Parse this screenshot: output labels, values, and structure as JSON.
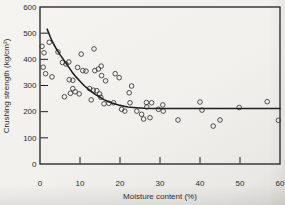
{
  "colors": {
    "paper": "#f2f1ee",
    "ink": "#1f1f1f",
    "marker_stroke": "#3d3d3d"
  },
  "chart_data": {
    "type": "scatter",
    "title": "",
    "xlabel": "Moisture content (%)",
    "ylabel": "Crushing strength (kg/cm²)",
    "xlim": [
      0,
      60
    ],
    "ylim": [
      0,
      600
    ],
    "x_ticks": [
      0,
      10,
      20,
      30,
      40,
      50,
      60
    ],
    "y_ticks": [
      0,
      100,
      200,
      300,
      400,
      500,
      600
    ],
    "grid": false,
    "legend": "none",
    "marker": "open-circle",
    "series": [
      {
        "name": "observed-crushing-strength",
        "type": "scatter",
        "points": [
          [
            0.5,
            450
          ],
          [
            1.0,
            425
          ],
          [
            2.3,
            465
          ],
          [
            4.5,
            428
          ],
          [
            0.8,
            370
          ],
          [
            1.4,
            345
          ],
          [
            3.0,
            333
          ],
          [
            5.6,
            388
          ],
          [
            6.5,
            382
          ],
          [
            7.2,
            390
          ],
          [
            9.4,
            369
          ],
          [
            10.7,
            357
          ],
          [
            11.5,
            355
          ],
          [
            10.3,
            420
          ],
          [
            13.5,
            440
          ],
          [
            13.7,
            357
          ],
          [
            14.6,
            363
          ],
          [
            15.3,
            374
          ],
          [
            7.3,
            322
          ],
          [
            8.2,
            320
          ],
          [
            6.1,
            257
          ],
          [
            7.6,
            270
          ],
          [
            8.2,
            288
          ],
          [
            8.8,
            276
          ],
          [
            9.8,
            268
          ],
          [
            12.4,
            288
          ],
          [
            13.3,
            282
          ],
          [
            14.2,
            280
          ],
          [
            14.9,
            268
          ],
          [
            12.8,
            245
          ],
          [
            15.4,
            338
          ],
          [
            16.4,
            318
          ],
          [
            15.2,
            255
          ],
          [
            16.0,
            230
          ],
          [
            17.2,
            232
          ],
          [
            18.4,
            234
          ],
          [
            18.8,
            345
          ],
          [
            19.8,
            330
          ],
          [
            20.4,
            209
          ],
          [
            21.2,
            202
          ],
          [
            22.3,
            272
          ],
          [
            22.9,
            298
          ],
          [
            22.5,
            234
          ],
          [
            24.2,
            202
          ],
          [
            25.4,
            190
          ],
          [
            25.9,
            172
          ],
          [
            26.6,
            235
          ],
          [
            26.7,
            218
          ],
          [
            27.5,
            177
          ],
          [
            27.9,
            234
          ],
          [
            29.6,
            209
          ],
          [
            30.8,
            202
          ],
          [
            30.7,
            226
          ],
          [
            34.5,
            168
          ],
          [
            40.0,
            237
          ],
          [
            40.5,
            206
          ],
          [
            43.3,
            145
          ],
          [
            45.0,
            168
          ],
          [
            49.8,
            216
          ],
          [
            56.8,
            238
          ],
          [
            59.6,
            167
          ]
        ]
      },
      {
        "name": "fitted-curve",
        "type": "line",
        "points": [
          [
            1.8,
            515
          ],
          [
            2.5,
            488
          ],
          [
            3,
            470
          ],
          [
            4,
            442
          ],
          [
            5,
            418
          ],
          [
            6,
            396
          ],
          [
            7,
            374
          ],
          [
            8,
            352
          ],
          [
            9,
            333
          ],
          [
            10,
            316
          ],
          [
            11,
            300
          ],
          [
            12,
            287
          ],
          [
            13,
            275
          ],
          [
            14,
            264
          ],
          [
            15,
            255
          ],
          [
            16,
            246
          ],
          [
            17,
            239
          ],
          [
            18,
            233
          ],
          [
            19,
            228
          ],
          [
            20,
            224
          ],
          [
            21,
            221
          ],
          [
            22,
            218
          ],
          [
            24,
            215
          ],
          [
            26,
            213
          ],
          [
            28,
            212
          ],
          [
            30,
            212
          ],
          [
            35,
            212
          ],
          [
            40,
            212
          ],
          [
            45,
            212
          ],
          [
            50,
            212
          ],
          [
            55,
            212
          ],
          [
            60,
            212
          ]
        ]
      }
    ]
  }
}
